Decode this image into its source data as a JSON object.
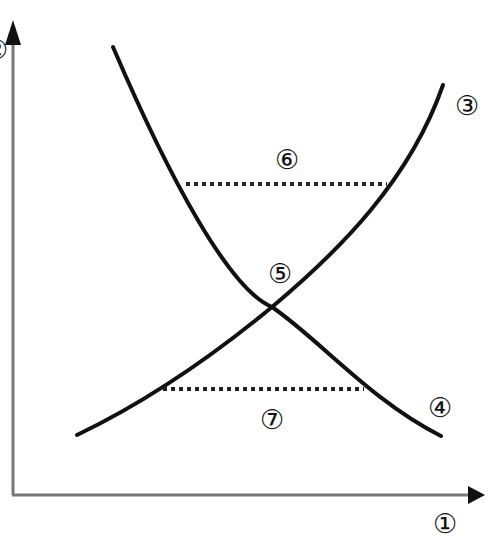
{
  "diagram": {
    "type": "supply-demand style crossing curves",
    "colors": {
      "axis": "#777777",
      "curve": "#111111",
      "dotted": "#222222",
      "background": "#ffffff"
    },
    "axes": {
      "x_axis_label": "①",
      "y_axis_label_partial": "②"
    },
    "curves": [
      {
        "id": "rising-curve",
        "label": "③"
      },
      {
        "id": "falling-curve",
        "label": "④"
      }
    ],
    "intersection_label": "⑤",
    "upper_dotted_line_label": "⑥",
    "lower_dotted_line_label": "⑦"
  }
}
